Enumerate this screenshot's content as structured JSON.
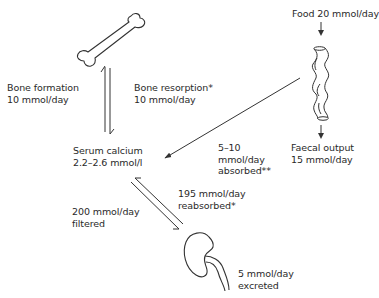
{
  "diagram": {
    "type": "calcium-homeostasis-flow",
    "nodes": {
      "bone": {
        "icon": "bone-icon"
      },
      "gut": {
        "icon": "intestine-icon"
      },
      "kidney": {
        "icon": "kidney-icon"
      },
      "serum": {
        "line1": "Serum calcium",
        "line2": "2.2–2.6 mmol/l"
      }
    },
    "labels": {
      "food": "Food 20 mmol/day",
      "bone_formation": {
        "line1": "Bone formation",
        "line2": "10 mmol/day"
      },
      "bone_resorption": {
        "line1": "Bone resorption*",
        "line2": "10 mmol/day"
      },
      "absorbed": {
        "line1": "5–10",
        "line2": "mmol/day",
        "line3": "absorbed**"
      },
      "faecal": {
        "line1": "Faecal output",
        "line2": "15 mmol/day"
      },
      "reabsorbed": {
        "line1": "195 mmol/day",
        "line2": "reabsorbed*"
      },
      "filtered": {
        "line1": "200 mmol/day",
        "line2": "filtered"
      },
      "excreted": {
        "line1": "5 mmol/day",
        "line2": "excreted"
      }
    },
    "flows": [
      {
        "from": "bone",
        "to": "serum",
        "label": "Bone resorption*",
        "value_mmol_day": 10
      },
      {
        "from": "serum",
        "to": "bone",
        "label": "Bone formation",
        "value_mmol_day": 10
      },
      {
        "from": "food",
        "to": "gut",
        "value_mmol_day": 20
      },
      {
        "from": "gut",
        "to": "serum",
        "label": "absorbed**",
        "value_mmol_day": "5–10"
      },
      {
        "from": "gut",
        "to": "faecal output",
        "value_mmol_day": 15
      },
      {
        "from": "serum",
        "to": "kidney",
        "label": "filtered",
        "value_mmol_day": 200
      },
      {
        "from": "kidney",
        "to": "serum",
        "label": "reabsorbed*",
        "value_mmol_day": 195
      },
      {
        "from": "kidney",
        "to": "excreted",
        "value_mmol_day": 5
      }
    ],
    "colors": {
      "stroke": "#333333",
      "text": "#2a2a2a",
      "background": "#ffffff"
    }
  }
}
